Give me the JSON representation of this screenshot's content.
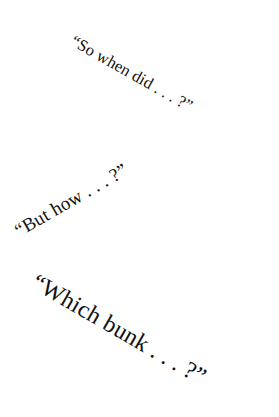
{
  "page": {
    "background_color": "#ffffff",
    "text_color": "#121212",
    "width": 279,
    "height": 417
  },
  "quotes": [
    {
      "id": "quote-1",
      "text": "“So when did . . . ?”",
      "rotation_deg": 29.5,
      "relative_size": "small"
    },
    {
      "id": "quote-2",
      "text": "“But how . . . ?”",
      "rotation_deg": -30,
      "relative_size": "medium"
    },
    {
      "id": "quote-3",
      "text": "“Which bunk . . . ?”",
      "rotation_deg": 30,
      "relative_size": "large"
    }
  ]
}
